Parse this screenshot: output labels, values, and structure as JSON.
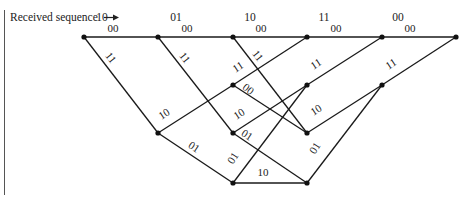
{
  "header": {
    "label": "Received sequence",
    "arrow": "→"
  },
  "received": [
    "10",
    "01",
    "10",
    "11",
    "00"
  ],
  "received_x": [
    102,
    176,
    250,
    324,
    398
  ],
  "nodes": [
    {
      "x": 84,
      "y": 37
    },
    {
      "x": 158,
      "y": 37
    },
    {
      "x": 233,
      "y": 37
    },
    {
      "x": 307,
      "y": 37
    },
    {
      "x": 382,
      "y": 37
    },
    {
      "x": 456,
      "y": 37
    },
    {
      "x": 233,
      "y": 85
    },
    {
      "x": 307,
      "y": 85
    },
    {
      "x": 382,
      "y": 85
    },
    {
      "x": 158,
      "y": 133
    },
    {
      "x": 233,
      "y": 133
    },
    {
      "x": 307,
      "y": 133
    },
    {
      "x": 233,
      "y": 183
    },
    {
      "x": 307,
      "y": 183
    }
  ],
  "edges": [
    {
      "from": [
        84,
        37
      ],
      "to": [
        158,
        37
      ],
      "label": "00",
      "lx": 113,
      "ly": 32,
      "rot": 0
    },
    {
      "from": [
        158,
        37
      ],
      "to": [
        233,
        37
      ],
      "label": "00",
      "lx": 187,
      "ly": 32,
      "rot": 0
    },
    {
      "from": [
        233,
        37
      ],
      "to": [
        307,
        37
      ],
      "label": "00",
      "lx": 261,
      "ly": 32,
      "rot": 0
    },
    {
      "from": [
        307,
        37
      ],
      "to": [
        382,
        37
      ],
      "label": "00",
      "lx": 336,
      "ly": 32,
      "rot": 0
    },
    {
      "from": [
        382,
        37
      ],
      "to": [
        456,
        37
      ],
      "label": "00",
      "lx": 410,
      "ly": 32,
      "rot": 0
    },
    {
      "from": [
        84,
        37
      ],
      "to": [
        158,
        133
      ],
      "label": "11",
      "lx": 108,
      "ly": 60,
      "rot": 52
    },
    {
      "from": [
        158,
        37
      ],
      "to": [
        233,
        133
      ],
      "label": "11",
      "lx": 182,
      "ly": 60,
      "rot": 52
    },
    {
      "from": [
        233,
        37
      ],
      "to": [
        307,
        133
      ],
      "label": "11",
      "lx": 255,
      "ly": 58,
      "rot": 52
    },
    {
      "from": [
        233,
        85
      ],
      "to": [
        307,
        37
      ],
      "label": "11",
      "lx": 240,
      "ly": 70,
      "rot": -33
    },
    {
      "from": [
        307,
        85
      ],
      "to": [
        382,
        37
      ],
      "label": "11",
      "lx": 318,
      "ly": 67,
      "rot": -33
    },
    {
      "from": [
        382,
        85
      ],
      "to": [
        456,
        37
      ],
      "label": "11",
      "lx": 393,
      "ly": 67,
      "rot": -33
    },
    {
      "from": [
        158,
        133
      ],
      "to": [
        233,
        85
      ],
      "label": "10",
      "lx": 166,
      "ly": 117,
      "rot": -33
    },
    {
      "from": [
        233,
        85
      ],
      "to": [
        307,
        133
      ],
      "label": "00",
      "lx": 246,
      "ly": 92,
      "rot": 38
    },
    {
      "from": [
        233,
        133
      ],
      "to": [
        307,
        85
      ],
      "label": "10",
      "lx": 241,
      "ly": 117,
      "rot": -33
    },
    {
      "from": [
        307,
        133
      ],
      "to": [
        382,
        85
      ],
      "label": "10",
      "lx": 318,
      "ly": 113,
      "rot": -33
    },
    {
      "from": [
        233,
        133
      ],
      "to": [
        307,
        183
      ],
      "label": "01",
      "lx": 245,
      "ly": 138,
      "rot": 33
    },
    {
      "from": [
        158,
        133
      ],
      "to": [
        233,
        183
      ],
      "label": "01",
      "lx": 192,
      "ly": 150,
      "rot": 33
    },
    {
      "from": [
        233,
        183
      ],
      "to": [
        307,
        85
      ],
      "label": "01",
      "lx": 236,
      "ly": 160,
      "rot": -58
    },
    {
      "from": [
        307,
        183
      ],
      "to": [
        382,
        85
      ],
      "label": "01",
      "lx": 318,
      "ly": 150,
      "rot": -58
    },
    {
      "from": [
        233,
        183
      ],
      "to": [
        307,
        183
      ],
      "label": "10",
      "lx": 263,
      "ly": 176,
      "rot": 0
    }
  ]
}
